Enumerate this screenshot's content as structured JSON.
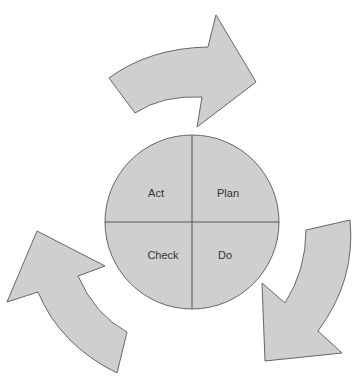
{
  "diagram": {
    "type": "PDCA cycle",
    "quadrants": [
      {
        "id": "act",
        "label": "Act"
      },
      {
        "id": "plan",
        "label": "Plan"
      },
      {
        "id": "check",
        "label": "Check"
      },
      {
        "id": "do",
        "label": "Do"
      }
    ],
    "arrows": [
      "top-arrow-clockwise",
      "right-arrow-clockwise",
      "left-arrow-clockwise"
    ],
    "colors": {
      "fill": "#cfcfcf",
      "stroke": "#666666",
      "divider": "#555555"
    }
  }
}
